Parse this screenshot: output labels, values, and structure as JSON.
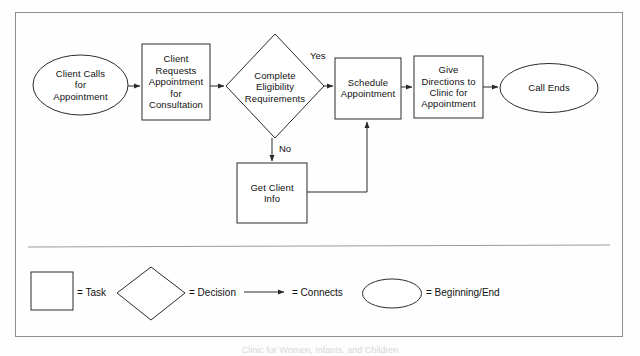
{
  "diagram": {
    "title_caption": "Clinic for Women, Infants, and Children",
    "colors": {
      "stroke": "#2b2b2b",
      "frame": "#8d8d8d",
      "text": "#111111",
      "background": "#fefefe"
    },
    "nodes": [
      {
        "id": "client-calls",
        "shape": "ellipse",
        "label": "Client Calls\nfor\nAppointment"
      },
      {
        "id": "client-requests",
        "shape": "rectangle",
        "label": "Client\nRequests\nAppointment\nfor\nConsultation"
      },
      {
        "id": "complete-eligibility",
        "shape": "diamond",
        "label": "Complete\nEligibility\nRequirements"
      },
      {
        "id": "schedule-appointment",
        "shape": "rectangle",
        "label": "Schedule\nAppointment"
      },
      {
        "id": "give-directions",
        "shape": "rectangle",
        "label": "Give\nDirections to\nClinic for\nAppointment"
      },
      {
        "id": "call-ends",
        "shape": "ellipse",
        "label": "Call Ends"
      },
      {
        "id": "get-client-info",
        "shape": "rectangle",
        "label": "Get Client\nInfo"
      }
    ],
    "edge_labels": {
      "yes": "Yes",
      "no": "No"
    }
  },
  "legend": {
    "items": [
      {
        "shape": "rectangle",
        "label": "= Task"
      },
      {
        "shape": "diamond",
        "label": "= Decision"
      },
      {
        "shape": "arrow",
        "label": "= Connects"
      },
      {
        "shape": "ellipse",
        "label": "= Beginning/End"
      }
    ]
  }
}
